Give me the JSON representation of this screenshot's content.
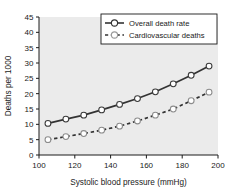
{
  "chart_data": {
    "type": "line",
    "title": "",
    "xlabel": "Systolic blood pressure (mmHg)",
    "ylabel": "Deaths per 1000",
    "x": [
      105,
      115,
      125,
      135,
      145,
      155,
      165,
      175,
      185,
      195
    ],
    "xlim": [
      100,
      200
    ],
    "ylim": [
      0,
      45
    ],
    "xticks": [
      100,
      120,
      140,
      160,
      180,
      200
    ],
    "yticks": [
      0,
      5,
      10,
      15,
      20,
      25,
      30,
      35,
      40,
      45
    ],
    "grid": false,
    "legend_position": "top-right",
    "series": [
      {
        "name": "Overall death rate",
        "linestyle": "solid",
        "marker": "circle-open",
        "color": "#333333",
        "values": [
          10.3,
          11.7,
          13.0,
          14.7,
          16.5,
          18.4,
          20.6,
          23.2,
          26.0,
          29.0
        ]
      },
      {
        "name": "Cardiovascular deaths",
        "linestyle": "dashed",
        "marker": "circle-open",
        "color": "#333333",
        "values": [
          5.0,
          6.0,
          7.0,
          8.1,
          9.4,
          11.1,
          13.0,
          15.0,
          17.7,
          20.5
        ]
      }
    ]
  },
  "style": {
    "plot_background": "#ebebeb",
    "axis_color": "#1a1a1a",
    "figure_background": "#ffffff",
    "legend_background": "#ffffff",
    "marker_fill": "#ffffff"
  },
  "legend": {
    "entries": [
      {
        "label": "Overall death rate",
        "linestyle": "solid"
      },
      {
        "label": "Cardiovascular deaths",
        "linestyle": "dashed"
      }
    ]
  },
  "axes": {
    "x_tick_labels": [
      "100",
      "120",
      "140",
      "160",
      "180",
      "200"
    ],
    "y_tick_labels": [
      "0",
      "5",
      "10",
      "15",
      "20",
      "25",
      "30",
      "35",
      "40",
      "45"
    ],
    "x_title": "Systolic blood pressure (mmHg)",
    "y_title": "Deaths per 1000"
  }
}
